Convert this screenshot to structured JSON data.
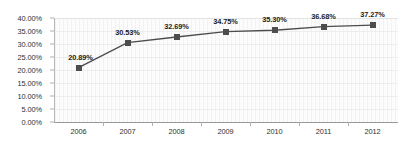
{
  "chart_data": {
    "type": "line",
    "title": "",
    "xlabel": "",
    "ylabel": "",
    "categories": [
      "2006",
      "2007",
      "2008",
      "2009",
      "2010",
      "2011",
      "2012"
    ],
    "values": [
      20.89,
      30.53,
      32.69,
      34.75,
      35.3,
      36.68,
      37.27
    ],
    "data_labels": [
      "20.89%",
      "30.53%",
      "32.69%",
      "34.75%",
      "35.30%",
      "36.68%",
      "37.27%"
    ],
    "series": [
      {
        "name": "",
        "values": [
          20.89,
          30.53,
          32.69,
          34.75,
          35.3,
          36.68,
          37.27
        ]
      }
    ],
    "ylim": [
      0,
      40
    ],
    "ytick_values": [
      0,
      5,
      10,
      15,
      20,
      25,
      30,
      35,
      40
    ],
    "ytick_labels": [
      "0.00%",
      "5.00%",
      "10.00%",
      "15.00%",
      "20.00%",
      "25.00%",
      "30.00%",
      "35.00%",
      "40.00%"
    ],
    "grid": true,
    "legend": "none",
    "marker": "square",
    "colors": {
      "line": "#4d4d4d",
      "marker": "#4d4d4d",
      "plot_background": "#fbfbfb",
      "gridline": "#ededed",
      "axis": "#9a9a9a",
      "text": "#2f2f2f"
    }
  }
}
